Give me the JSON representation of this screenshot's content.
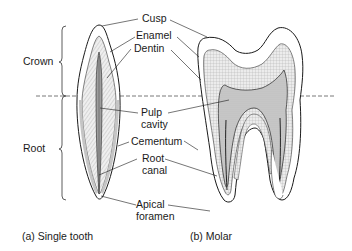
{
  "regions": {
    "crown": "Crown",
    "root": "Root"
  },
  "labels": {
    "cusp": "Cusp",
    "enamel": "Enamel",
    "dentin": "Dentin",
    "pulp_line1": "Pulp",
    "pulp_line2": "cavity",
    "cementum": "Cementum",
    "root_canal_line1": "Root",
    "root_canal_line2": "canal",
    "apical_line1": "Apical",
    "apical_line2": "foramen"
  },
  "captions": {
    "single_tooth": "(a) Single tooth",
    "molar": "(b) Molar"
  },
  "colors": {
    "line": "#1a1a1a",
    "dentin_fill": "#e6e6e6",
    "pulp_fill": "#bdbdbd",
    "cementum_fill": "#d4d4d4",
    "dash": "#555555"
  }
}
